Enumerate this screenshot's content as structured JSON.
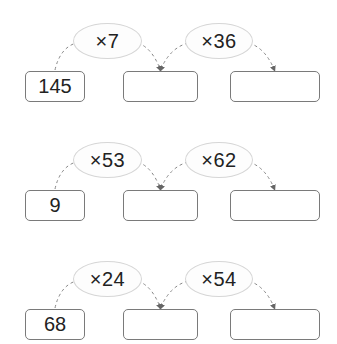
{
  "worksheet": {
    "rows": [
      {
        "start": "145",
        "op1": "×7",
        "op2": "×36",
        "answer1": "",
        "answer2": ""
      },
      {
        "start": "9",
        "op1": "×53",
        "op2": "×62",
        "answer1": "",
        "answer2": ""
      },
      {
        "start": "68",
        "op1": "×24",
        "op2": "×54",
        "answer1": "",
        "answer2": ""
      }
    ]
  },
  "colors": {
    "oval_border": "#d6d6d6",
    "box_border": "#7a7a7a",
    "arrow": "#777777"
  }
}
